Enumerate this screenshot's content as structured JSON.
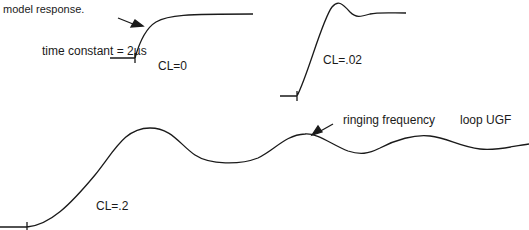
{
  "caption_fragment": "model response.",
  "annotations": {
    "time_constant": "time constant = 2µs",
    "ringing": "ringing frequency",
    "loop_ugf": "loop UGF"
  },
  "curves": [
    {
      "label": "CL=0"
    },
    {
      "label": "CL=.02"
    },
    {
      "label": "CL=.2"
    }
  ],
  "colors": {
    "stroke": "#1a1a1a",
    "background": "#ffffff"
  }
}
